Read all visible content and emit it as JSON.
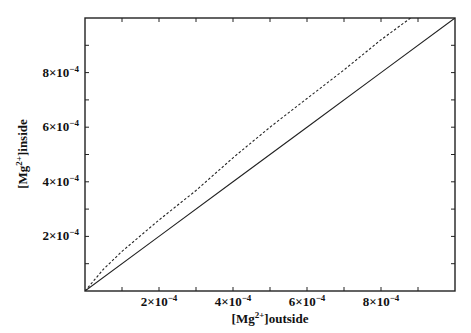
{
  "chart_data": {
    "type": "line",
    "title": "",
    "xlabel": "[Mg2+]outside",
    "ylabel": "[Mg2+]inside",
    "xlabel_parts": {
      "pre": "[Mg",
      "sup": "2+",
      "post": "]outside"
    },
    "ylabel_parts": {
      "pre": "[Mg",
      "sup": "2+",
      "post": "]inside"
    },
    "xlim": [
      0,
      0.001
    ],
    "ylim": [
      0,
      0.001
    ],
    "grid": false,
    "legend": null,
    "x_ticks": [
      {
        "value": 0.0002,
        "mant": "2",
        "exp": "-4"
      },
      {
        "value": 0.0004,
        "mant": "4",
        "exp": "-4"
      },
      {
        "value": 0.0006,
        "mant": "6",
        "exp": "-4"
      },
      {
        "value": 0.0008,
        "mant": "8",
        "exp": "-4"
      }
    ],
    "y_ticks": [
      {
        "value": 0.0002,
        "mant": "2",
        "exp": "-4"
      },
      {
        "value": 0.0004,
        "mant": "4",
        "exp": "-4"
      },
      {
        "value": 0.0006,
        "mant": "6",
        "exp": "-4"
      },
      {
        "value": 0.0008,
        "mant": "8",
        "exp": "-4"
      }
    ],
    "minor_tick_step": 0.0001,
    "series": [
      {
        "name": "solid",
        "style": "solid",
        "x": [
          0,
          0.0002,
          0.0004,
          0.0006,
          0.0008,
          0.001
        ],
        "y": [
          0,
          0.0002,
          0.0004,
          0.0006,
          0.0008,
          0.001
        ]
      },
      {
        "name": "dashed",
        "style": "dashed",
        "x": [
          0,
          5e-05,
          0.0001,
          0.0002,
          0.0003,
          0.0004,
          0.0005,
          0.0006,
          0.0007,
          0.0008,
          0.00088
        ],
        "y": [
          0,
          8e-05,
          0.000145,
          0.00026,
          0.000368,
          0.000488,
          0.0006,
          0.000705,
          0.00081,
          0.00092,
          0.001
        ]
      }
    ]
  }
}
